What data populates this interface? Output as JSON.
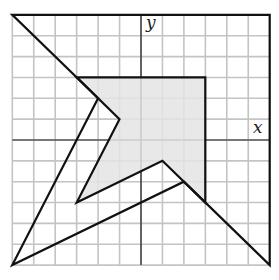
{
  "diagram": {
    "type": "coordinate-grid-dilation",
    "grid": {
      "xmin": -6,
      "xmax": 6,
      "ymin": -6,
      "ymax": 6,
      "step": 1
    },
    "axes": {
      "x_label": "x",
      "y_label": "y"
    },
    "outer_polygon": {
      "label": "dilated image",
      "vertices": [
        [
          -6,
          6
        ],
        [
          6,
          6
        ],
        [
          6,
          -6
        ],
        [
          2,
          -2
        ],
        [
          -6,
          -6
        ],
        [
          -2,
          2
        ]
      ]
    },
    "inner_polygon": {
      "label": "shaded original",
      "shaded": true,
      "vertices": [
        [
          -3,
          3
        ],
        [
          3,
          3
        ],
        [
          3,
          -3
        ],
        [
          1,
          -1
        ],
        [
          -3,
          -3
        ],
        [
          -1,
          1
        ]
      ]
    },
    "colors": {
      "grid": "#c4c4c4",
      "lines": "#111111",
      "shade": "#e4e4e4"
    }
  }
}
